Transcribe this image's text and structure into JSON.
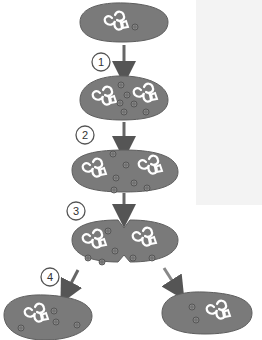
{
  "diagram": {
    "type": "binary-fission",
    "colors": {
      "cell_fill": "#7a7a7a",
      "cell_stroke": "#5e5e5e",
      "dna_stroke": "#ffffff",
      "plasmid_fill": "#8a8a8a",
      "plasmid_stroke": "#4a4a4a",
      "arrow": "#555555",
      "circle_stroke": "#555555"
    },
    "stage_labels": [
      "1",
      "2",
      "3",
      "4"
    ],
    "steps": [
      {
        "number": "1)",
        "lines": [
          "The",
          "The",
          "bu"
        ]
      },
      {
        "number": "2)",
        "lines": [
          "The",
          "to"
        ]
      },
      {
        "number": "3)",
        "lines": [
          "The",
          "(ar"
        ]
      },
      {
        "number": "4)",
        "lines": [
          "The",
          "Ea",
          "ca"
        ]
      }
    ]
  }
}
